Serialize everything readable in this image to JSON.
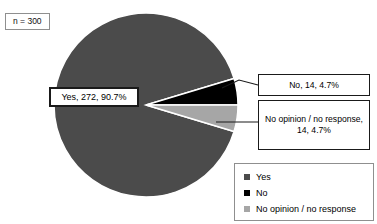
{
  "sample_size_note": "n = 300",
  "chart_data": {
    "type": "pie",
    "title": "",
    "total": 300,
    "categories": [
      "Yes",
      "No",
      "No opinion / no response"
    ],
    "values": [
      272,
      14,
      14
    ],
    "percents": [
      "90.7%",
      "4.7%",
      "4.7%"
    ],
    "colors": [
      "#4b4b4b",
      "#000000",
      "#a6a6a6"
    ],
    "legend_position": "bottom-right",
    "grid": false,
    "annotations": [
      "Yes, 272, 90.7%",
      "No, 14, 4.7%",
      "No opinion / no response, 14, 4.7%"
    ]
  },
  "callouts": {
    "yes": "Yes, 272, 90.7%",
    "no": "No, 14, 4.7%",
    "no_opinion": "No opinion / no response, 14, 4.7%"
  },
  "legend": {
    "items": [
      {
        "label": "Yes",
        "color": "#4b4b4b"
      },
      {
        "label": "No",
        "color": "#000000"
      },
      {
        "label": "No opinion / no response",
        "color": "#a6a6a6"
      }
    ]
  }
}
